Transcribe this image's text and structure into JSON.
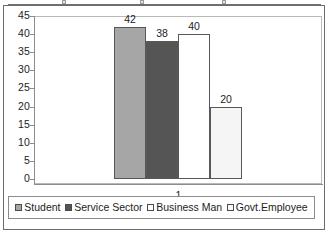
{
  "chart_data": {
    "type": "bar",
    "title": "",
    "xlabel": "",
    "ylabel": "",
    "categories": [
      "1"
    ],
    "category_label": "1",
    "series": [
      {
        "name": "Student",
        "values": [
          42
        ],
        "color": "#a6a6a6"
      },
      {
        "name": "Service Sector",
        "values": [
          38
        ],
        "color": "#555555"
      },
      {
        "name": "Business Man",
        "values": [
          40
        ],
        "color": "#ffffff"
      },
      {
        "name": "Govt.Employee",
        "values": [
          20
        ],
        "color": "#f2f2f2"
      }
    ],
    "data_labels": [
      "42",
      "38",
      "40",
      "20"
    ],
    "ylim": [
      0,
      45
    ],
    "ytick_step": 5,
    "yticks": [
      "45",
      "40",
      "35",
      "30",
      "25",
      "20",
      "15",
      "10",
      "5",
      "0"
    ],
    "grid": false,
    "legend_position": "bottom",
    "legend_entries": [
      {
        "label": "Student",
        "swatch_color": "#a6a6a6"
      },
      {
        "label": "Service Sector",
        "swatch_color": "#555555"
      },
      {
        "label": "Business Man",
        "swatch_color": "#ffffff"
      },
      {
        "label": "Govt.Employee",
        "swatch_color": "#f7f7f7"
      }
    ]
  },
  "axis": {
    "y_ticks": [
      "45",
      "40",
      "35",
      "30",
      "25",
      "20",
      "15",
      "10",
      "5",
      "0"
    ]
  },
  "bars": [
    {
      "name": "Student",
      "label": "42",
      "value": 42,
      "color": "#a6a6a6"
    },
    {
      "name": "Service Sector",
      "label": "38",
      "value": 38,
      "color": "#555555"
    },
    {
      "name": "Business Man",
      "label": "40",
      "value": 40,
      "color": "#ffffff"
    },
    {
      "name": "Govt.Employee",
      "label": "20",
      "value": 20,
      "color": "#f5f5f5"
    }
  ],
  "x_axis": {
    "category": "1"
  },
  "legend": {
    "items": [
      {
        "label": "Student",
        "color": "#a6a6a6"
      },
      {
        "label": "Service Sector",
        "color": "#555555"
      },
      {
        "label": "Business Man",
        "color": "#ffffff"
      },
      {
        "label": "Govt.Employee",
        "color": "#f7f7f7"
      }
    ]
  }
}
